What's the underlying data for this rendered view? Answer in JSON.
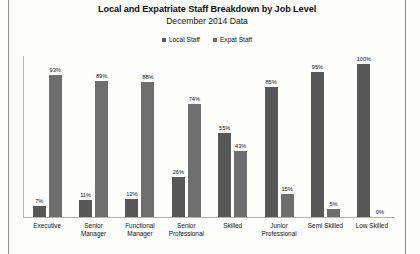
{
  "chart_data": {
    "type": "bar",
    "title": "Local and Expatriate Staff Breakdown by Job Level",
    "subtitle": "December 2014 Data",
    "xlabel": "",
    "ylabel": "",
    "ylim": [
      0,
      100
    ],
    "grid": false,
    "legend_position": "top-center",
    "categories": [
      "Executive",
      "Senior Manager",
      "Functional Manager",
      "Senior Professional",
      "Skilled",
      "Junior Professional",
      "Semi Skilled",
      "Low Skilled"
    ],
    "series": [
      {
        "name": "Local Staff",
        "color": "#585858",
        "values": [
          7,
          11,
          12,
          26,
          55,
          85,
          95,
          100
        ],
        "labels": [
          "7%",
          "11%",
          "12%",
          "26%",
          "55%",
          "85%",
          "95%",
          "100%"
        ]
      },
      {
        "name": "Expat Staff",
        "color": "#6e6e6e",
        "values": [
          93,
          89,
          88,
          74,
          43,
          15,
          5,
          0
        ],
        "labels": [
          "93%",
          "89%",
          "88%",
          "74%",
          "43%",
          "15%",
          "5%",
          "0%"
        ]
      }
    ]
  },
  "category_lines": [
    [
      "Executive"
    ],
    [
      "Senior",
      "Manager"
    ],
    [
      "Functional",
      "Manager"
    ],
    [
      "Senior",
      "Professional"
    ],
    [
      "Skilled"
    ],
    [
      "Junior",
      "Professional"
    ],
    [
      "Semi Skilled"
    ],
    [
      "Low Skilled"
    ]
  ]
}
